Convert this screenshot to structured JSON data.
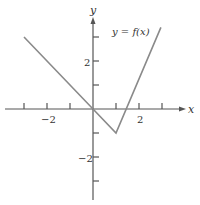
{
  "chart_data": {
    "type": "line",
    "title": "",
    "xlabel": "x",
    "ylabel": "y",
    "legend": [],
    "annotations": [
      "y = f(x)"
    ],
    "grid": false,
    "xlim": [
      -3.8,
      3.9
    ],
    "ylim": [
      -3.8,
      3.8
    ],
    "x_ticks": [
      -3,
      -2,
      -1,
      1,
      2,
      3
    ],
    "x_tick_labels": [
      {
        "value": -2,
        "label": "−2"
      },
      {
        "value": 2,
        "label": "2"
      }
    ],
    "y_ticks": [
      3,
      2,
      1,
      -1,
      -2,
      -3
    ],
    "y_tick_labels": [
      {
        "value": 2,
        "label": "2"
      },
      {
        "value": -2,
        "label": "−2"
      }
    ],
    "series": [
      {
        "name": "y = f(x)",
        "x": [
          -3,
          0,
          1,
          2.95
        ],
        "y": [
          3,
          0,
          -1,
          3.4
        ]
      }
    ]
  },
  "labels": {
    "x_axis": "x",
    "y_axis": "y",
    "function": "y = f(x)",
    "x_tick_neg2": "−2",
    "x_tick_2": "2",
    "y_tick_2": "2",
    "y_tick_neg2": "−2"
  },
  "colors": {
    "axis": "#555555",
    "curve": "#8a8a8a",
    "text": "#333333"
  }
}
